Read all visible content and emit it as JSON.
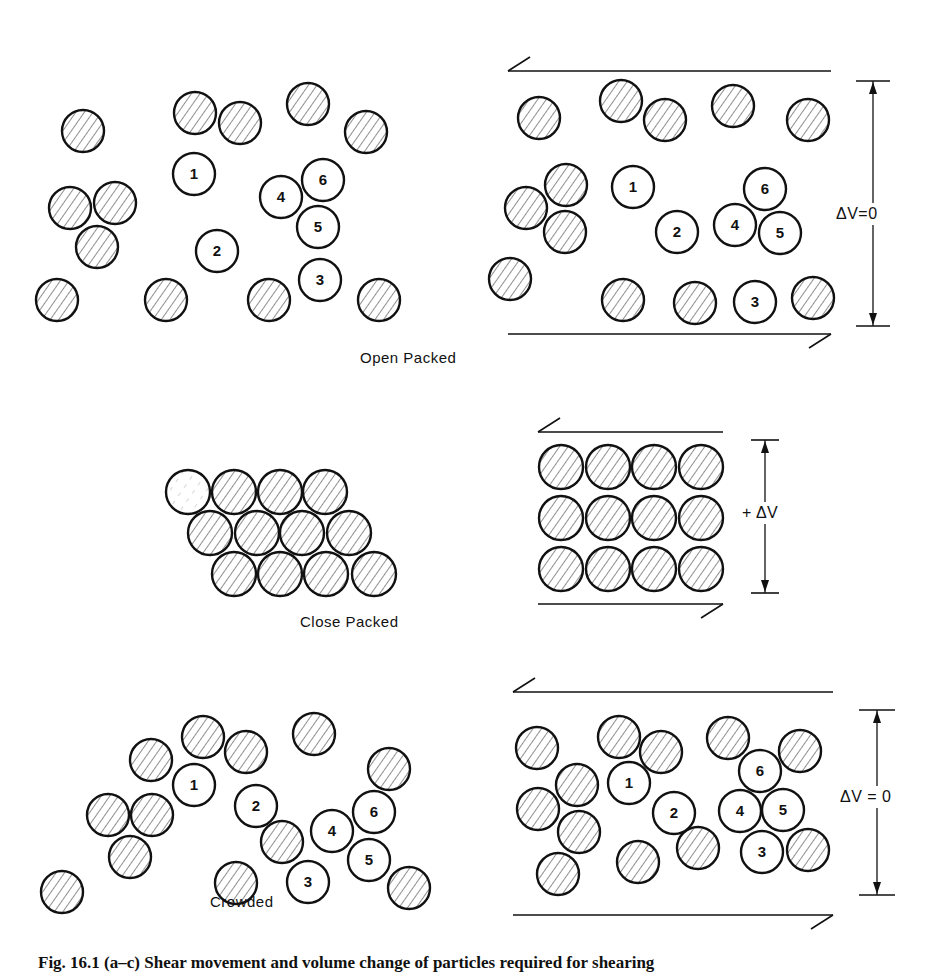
{
  "figure": {
    "panels": [
      {
        "id": "open-packed",
        "label": "Open Packed",
        "label_pos": [
          440,
          357
        ],
        "radius": 21,
        "left": {
          "hatched": [
            [
              83,
              131
            ],
            [
              195,
              113
            ],
            [
              240,
              123
            ],
            [
              308,
              104
            ],
            [
              366,
              132
            ],
            [
              70,
              208
            ],
            [
              115,
              203
            ],
            [
              97,
              247
            ],
            [
              57,
              300
            ],
            [
              166,
              300
            ],
            [
              269,
              300
            ],
            [
              379,
              300
            ]
          ],
          "numbered": [
            {
              "n": "1",
              "c": [
                194,
                174
              ]
            },
            {
              "n": "2",
              "c": [
                217,
                251
              ]
            },
            {
              "n": "3",
              "c": [
                320,
                280
              ]
            },
            {
              "n": "4",
              "c": [
                281,
                197
              ]
            },
            {
              "n": "5",
              "c": [
                318,
                227
              ]
            },
            {
              "n": "6",
              "c": [
                323,
                180
              ]
            }
          ]
        },
        "right": {
          "hatched": [
            [
              539,
              118
            ],
            [
              621,
              101
            ],
            [
              665,
              120
            ],
            [
              733,
              106
            ],
            [
              808,
              120
            ],
            [
              526,
              208
            ],
            [
              566,
              185
            ],
            [
              565,
              232
            ],
            [
              510,
              279
            ],
            [
              623,
              300
            ],
            [
              695,
              303
            ],
            [
              813,
              298
            ]
          ],
          "numbered": [
            {
              "n": "1",
              "c": [
                633,
                187
              ]
            },
            {
              "n": "2",
              "c": [
                677,
                232
              ]
            },
            {
              "n": "3",
              "c": [
                755,
                302
              ]
            },
            {
              "n": "4",
              "c": [
                735,
                225
              ]
            },
            {
              "n": "5",
              "c": [
                780,
                233
              ]
            },
            {
              "n": "6",
              "c": [
                765,
                189
              ]
            }
          ],
          "shear_top": {
            "x1": 508,
            "x2": 831,
            "y": 71,
            "arrow": "left"
          },
          "shear_bottom": {
            "x1": 508,
            "x2": 831,
            "y": 334,
            "arrow": "right"
          },
          "dimension": {
            "x": 873,
            "y1": 81,
            "y2": 326,
            "tick_half": 17,
            "label": "ΔV=0",
            "label_pos": [
              835,
              211
            ]
          }
        }
      },
      {
        "id": "close-packed",
        "label": "Close Packed",
        "label_pos": [
          367,
          622
        ],
        "radius": 22,
        "left": {
          "hatched": [
            [
              234,
              492
            ],
            [
              280,
              492
            ],
            [
              325,
              492
            ],
            [
              210,
              533
            ],
            [
              257,
              533
            ],
            [
              302,
              533
            ],
            [
              349,
              533
            ],
            [
              234,
              574
            ],
            [
              280,
              574
            ],
            [
              326,
              574
            ],
            [
              374,
              574
            ]
          ],
          "faded": [
            [
              188,
              492
            ]
          ],
          "numbered": []
        },
        "right": {
          "hatched": [
            [
              561,
              467
            ],
            [
              608,
              467
            ],
            [
              654,
              467
            ],
            [
              701,
              467
            ],
            [
              561,
              518
            ],
            [
              608,
              518
            ],
            [
              654,
              518
            ],
            [
              701,
              518
            ],
            [
              561,
              569
            ],
            [
              608,
              569
            ],
            [
              654,
              569
            ],
            [
              701,
              569
            ]
          ],
          "numbered": [],
          "shear_top": {
            "x1": 538,
            "x2": 723,
            "y": 432,
            "arrow": "left"
          },
          "shear_bottom": {
            "x1": 538,
            "x2": 723,
            "y": 604,
            "arrow": "right"
          },
          "dimension": {
            "x": 765,
            "y1": 440,
            "y2": 593,
            "tick_half": 14,
            "label": "+ ΔV",
            "label_pos": [
              741,
              510
            ]
          }
        }
      },
      {
        "id": "crowded",
        "label": "Crowded",
        "label_pos": [
          237,
          902
        ],
        "radius": 21,
        "left": {
          "hatched": [
            [
              151,
              760
            ],
            [
              203,
              737
            ],
            [
              246,
              752
            ],
            [
              314,
              734
            ],
            [
              389,
              769
            ],
            [
              108,
              815
            ],
            [
              152,
              815
            ],
            [
              130,
              857
            ],
            [
              62,
              892
            ],
            [
              236,
              883
            ],
            [
              282,
              842
            ],
            [
              409,
              888
            ]
          ],
          "numbered": [
            {
              "n": "1",
              "c": [
                194,
                785
              ]
            },
            {
              "n": "2",
              "c": [
                256,
                806
              ]
            },
            {
              "n": "3",
              "c": [
                308,
                882
              ]
            },
            {
              "n": "4",
              "c": [
                332,
                831
              ]
            },
            {
              "n": "5",
              "c": [
                369,
                860
              ]
            },
            {
              "n": "6",
              "c": [
                374,
                812
              ]
            }
          ]
        },
        "right": {
          "hatched": [
            [
              537,
              748
            ],
            [
              619,
              737
            ],
            [
              661,
              752
            ],
            [
              728,
              738
            ],
            [
              800,
              751
            ],
            [
              538,
              809
            ],
            [
              577,
              785
            ],
            [
              579,
              832
            ],
            [
              558,
              874
            ],
            [
              638,
              862
            ],
            [
              698,
              848
            ],
            [
              808,
              850
            ]
          ],
          "numbered": [
            {
              "n": "1",
              "c": [
                629,
                783
              ]
            },
            {
              "n": "2",
              "c": [
                674,
                813
              ]
            },
            {
              "n": "3",
              "c": [
                762,
                852
              ]
            },
            {
              "n": "4",
              "c": [
                740,
                811
              ]
            },
            {
              "n": "5",
              "c": [
                783,
                810
              ]
            },
            {
              "n": "6",
              "c": [
                760,
                771
              ]
            }
          ],
          "shear_top": {
            "x1": 513,
            "x2": 833,
            "y": 692,
            "arrow": "left"
          },
          "shear_bottom": {
            "x1": 513,
            "x2": 833,
            "y": 915,
            "arrow": "right"
          },
          "dimension": {
            "x": 877,
            "y1": 710,
            "y2": 895,
            "tick_half": 18,
            "label": "ΔV = 0",
            "label_pos": [
              841,
              793
            ]
          }
        }
      }
    ],
    "caption": "Fig. 16.1  (a–c) Shear movement and volume change of particles required for shearing"
  },
  "style": {
    "stroke": "#111111",
    "hatch": "#333333",
    "background": "#ffffff"
  }
}
